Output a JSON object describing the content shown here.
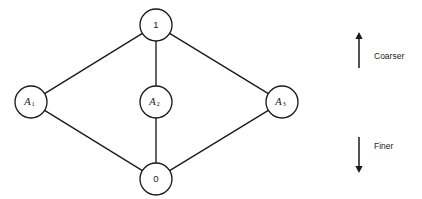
{
  "diagram": {
    "type": "hasse-lattice",
    "background_color": "#ffffff",
    "line_color": "#1a1a1a",
    "nodes": [
      {
        "id": "top",
        "label": "1",
        "sub": "",
        "cx": 156,
        "cy": 25,
        "r": 16
      },
      {
        "id": "a1",
        "label": "A",
        "sub": "1",
        "cx": 31,
        "cy": 102,
        "r": 16
      },
      {
        "id": "a2",
        "label": "A",
        "sub": "2",
        "cx": 156,
        "cy": 102,
        "r": 16
      },
      {
        "id": "a3",
        "label": "A",
        "sub": "3",
        "cx": 282,
        "cy": 102,
        "r": 16
      },
      {
        "id": "bottom",
        "label": "0",
        "sub": "",
        "cx": 156,
        "cy": 179,
        "r": 16
      }
    ],
    "edges": [
      {
        "from": "top",
        "to": "a1"
      },
      {
        "from": "top",
        "to": "a2"
      },
      {
        "from": "top",
        "to": "a3"
      },
      {
        "from": "a1",
        "to": "bottom"
      },
      {
        "from": "a2",
        "to": "bottom"
      },
      {
        "from": "a3",
        "to": "bottom"
      }
    ]
  },
  "annotations": {
    "coarser": {
      "label": "Coarser",
      "direction": "up",
      "x": 359,
      "y_start": 68,
      "y_end": 32,
      "label_x": 374,
      "label_y": 57
    },
    "finer": {
      "label": "Finer",
      "direction": "down",
      "x": 359,
      "y_start": 137,
      "y_end": 173,
      "label_x": 374,
      "label_y": 147
    }
  }
}
